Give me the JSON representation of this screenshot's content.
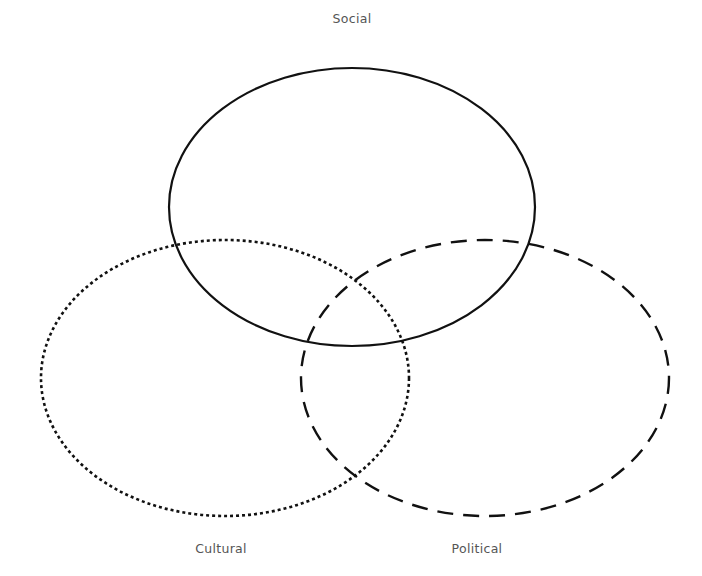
{
  "diagram": {
    "type": "venn",
    "sets": [
      {
        "id": "social",
        "label": "Social",
        "line_style": "solid",
        "cx": 352,
        "cy": 207,
        "rx": 183,
        "ry": 139,
        "label_x": 352,
        "label_y": 11
      },
      {
        "id": "cultural",
        "label": "Cultural",
        "line_style": "dotted",
        "cx": 225,
        "cy": 378,
        "rx": 184,
        "ry": 138,
        "label_x": 221,
        "label_y": 541
      },
      {
        "id": "political",
        "label": "Political",
        "line_style": "dashed",
        "cx": 485,
        "cy": 378,
        "rx": 184,
        "ry": 138,
        "label_x": 477,
        "label_y": 541
      }
    ],
    "stroke_color": "#111111",
    "label_color": "#555555",
    "background": "#ffffff"
  }
}
